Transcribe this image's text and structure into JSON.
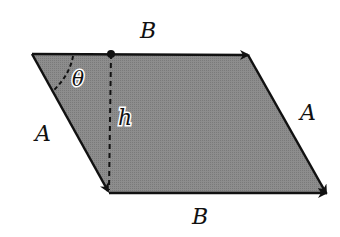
{
  "diagram": {
    "fill_color": "#8a8a8a",
    "stroke_color": "#111111",
    "vertices": {
      "top_left": [
        32,
        54
      ],
      "top_right": [
        248,
        55
      ],
      "bottom_right": [
        326,
        193
      ],
      "bottom_left": [
        109,
        193
      ]
    },
    "labels": {
      "top_side": "B",
      "bottom_side": "B",
      "left_side": "A",
      "right_side": "A",
      "height": "h",
      "angle": "θ"
    }
  }
}
